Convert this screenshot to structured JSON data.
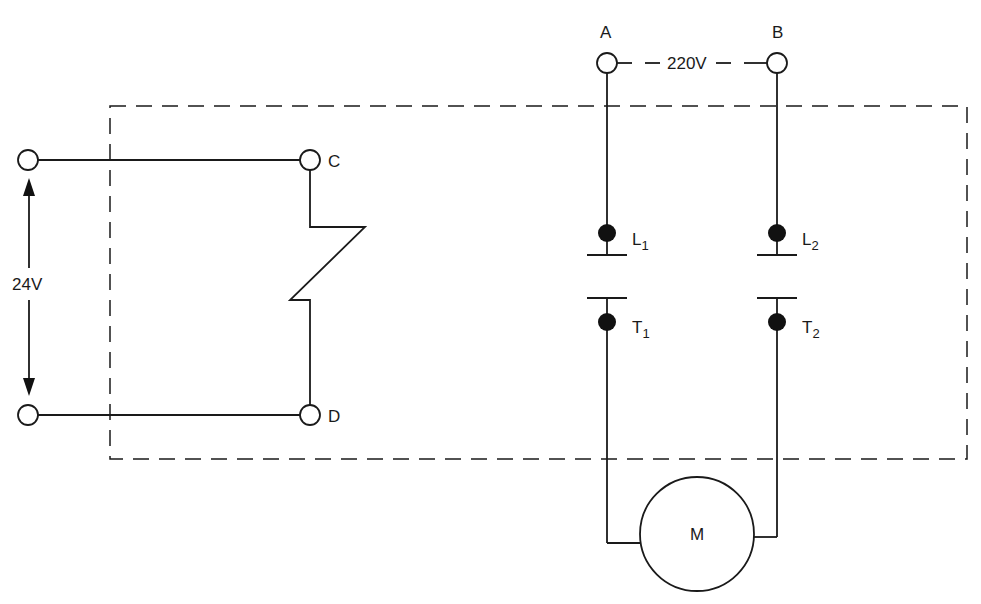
{
  "diagram": {
    "type": "circuit",
    "control_circuit": {
      "voltage_label": "24V",
      "terminals": [
        "C",
        "D"
      ],
      "component": "contactor coil"
    },
    "power_circuit": {
      "supply_voltage_label": "220V",
      "supply_terminals": [
        "A",
        "B"
      ],
      "line_contacts": [
        {
          "label": "L",
          "sub": "1"
        },
        {
          "label": "L",
          "sub": "2"
        }
      ],
      "load_contacts": [
        {
          "label": "T",
          "sub": "1"
        },
        {
          "label": "T",
          "sub": "2"
        }
      ],
      "load": {
        "label": "M"
      }
    },
    "enclosure": "dashed-boundary"
  }
}
